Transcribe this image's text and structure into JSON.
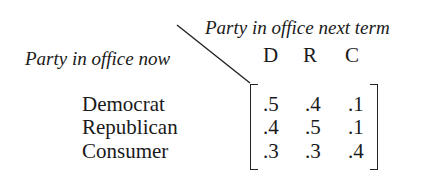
{
  "labels": {
    "column_axis": "Party in office next term",
    "row_axis": "Party in office now"
  },
  "columns": [
    "D",
    "R",
    "C"
  ],
  "rows": [
    {
      "label": "Democrat",
      "values": [
        ".5",
        ".4",
        ".1"
      ]
    },
    {
      "label": "Republican",
      "values": [
        ".4",
        ".5",
        ".1"
      ]
    },
    {
      "label": "Consumer",
      "values": [
        ".3",
        ".3",
        ".4"
      ]
    }
  ]
}
